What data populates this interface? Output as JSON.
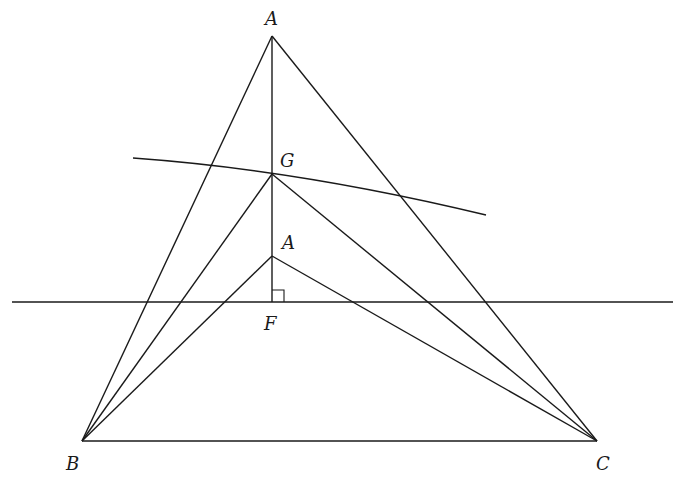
{
  "diagram": {
    "type": "geometry-construction",
    "points": {
      "A_top": {
        "label": "A",
        "x": 272,
        "y": 36
      },
      "G": {
        "label": "G",
        "x": 272,
        "y": 174
      },
      "A_low": {
        "label": "A",
        "x": 272,
        "y": 256
      },
      "F": {
        "label": "F",
        "x": 272,
        "y": 302
      },
      "B": {
        "label": "B",
        "x": 82,
        "y": 441
      },
      "C": {
        "label": "C",
        "x": 597,
        "y": 441
      }
    },
    "labels": {
      "a_top": "A",
      "g": "G",
      "a_low": "A",
      "f": "F",
      "b": "B",
      "c": "C"
    },
    "horizontal_line": {
      "x1": 12,
      "y": 302,
      "x2": 673
    },
    "arc": {
      "start": [
        133,
        158
      ],
      "through": [
        272,
        174
      ],
      "end": [
        486,
        215
      ]
    },
    "right_angle_marker": {
      "at": "F",
      "size": 12
    }
  }
}
